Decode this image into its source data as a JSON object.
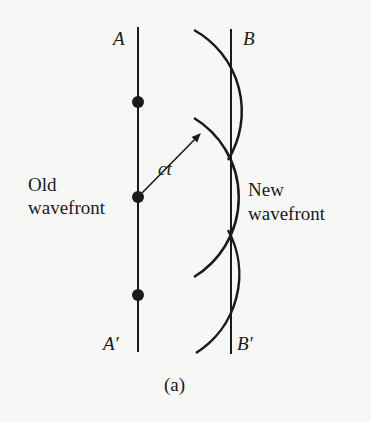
{
  "diagram": {
    "type": "huygens-wavefront-construction",
    "caption": "(a)",
    "labels": {
      "old_top": "A",
      "old_bottom": "A′",
      "new_top": "B",
      "new_bottom": "B′",
      "old_wavefront_line1": "Old",
      "old_wavefront_line2": "wavefront",
      "new_wavefront_line1": "New",
      "new_wavefront_line2": "wavefront",
      "radius": "ct"
    },
    "sources": 3,
    "colors": {
      "ink": "#1a1a1a",
      "background": "#f7f7f5"
    }
  }
}
